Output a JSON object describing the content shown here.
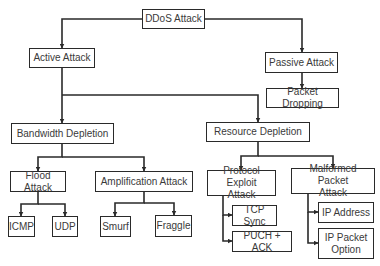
{
  "diagram": {
    "type": "hierarchy",
    "nodes": [
      {
        "id": "ddos",
        "label": "DDoS Attack",
        "x": 142,
        "y": 9,
        "w": 63,
        "h": 20
      },
      {
        "id": "active",
        "label": "Active Attack",
        "x": 29,
        "y": 48,
        "w": 66,
        "h": 20
      },
      {
        "id": "passive",
        "label": "Passive Attack",
        "x": 265,
        "y": 52,
        "w": 73,
        "h": 21
      },
      {
        "id": "packet_dropping",
        "label": "Packet Dropping",
        "x": 266,
        "y": 88,
        "w": 73,
        "h": 20
      },
      {
        "id": "bandwidth",
        "label": "Bandwidth Depletion",
        "x": 11,
        "y": 123,
        "w": 103,
        "h": 21
      },
      {
        "id": "resource",
        "label": "Resource Depletion",
        "x": 206,
        "y": 122,
        "w": 104,
        "h": 20
      },
      {
        "id": "flood",
        "label": "Flood Attack",
        "x": 10,
        "y": 171,
        "w": 56,
        "h": 21
      },
      {
        "id": "amplification",
        "label": "Amplification Attack",
        "x": 95,
        "y": 171,
        "w": 98,
        "h": 21
      },
      {
        "id": "protocol",
        "label": "Protocol Exploit\nAttack",
        "x": 207,
        "y": 170,
        "w": 69,
        "h": 26
      },
      {
        "id": "malformed",
        "label": "Malformed Packet\nAttack",
        "x": 291,
        "y": 168,
        "w": 84,
        "h": 26
      },
      {
        "id": "icmp",
        "label": "ICMP",
        "x": 8,
        "y": 216,
        "w": 27,
        "h": 21
      },
      {
        "id": "udp",
        "label": "UDP",
        "x": 52,
        "y": 216,
        "w": 26,
        "h": 21
      },
      {
        "id": "smurf",
        "label": "Smurf",
        "x": 100,
        "y": 216,
        "w": 31,
        "h": 21
      },
      {
        "id": "fraggle",
        "label": "Fraggle",
        "x": 155,
        "y": 215,
        "w": 37,
        "h": 22
      },
      {
        "id": "tcp_sync",
        "label": "TCP Sync",
        "x": 232,
        "y": 205,
        "w": 45,
        "h": 21
      },
      {
        "id": "puch_ack",
        "label": "PUCH + ACK",
        "x": 232,
        "y": 231,
        "w": 60,
        "h": 21
      },
      {
        "id": "ip_address",
        "label": "IP Address",
        "x": 318,
        "y": 202,
        "w": 56,
        "h": 21
      },
      {
        "id": "ip_packet_option",
        "label": "IP Packet\nOption",
        "x": 318,
        "y": 228,
        "w": 56,
        "h": 31
      }
    ],
    "edges": [
      {
        "from": "ddos",
        "to": "active",
        "points": [
          [
            142,
            19
          ],
          [
            62,
            19
          ],
          [
            62,
            48
          ]
        ]
      },
      {
        "from": "ddos",
        "to": "passive",
        "points": [
          [
            205,
            19
          ],
          [
            302,
            19
          ],
          [
            302,
            52
          ]
        ]
      },
      {
        "from": "passive",
        "to": "packet_dropping",
        "points": [
          [
            302,
            73
          ],
          [
            302,
            88
          ]
        ]
      },
      {
        "from": "active",
        "to": "bandwidth",
        "points": [
          [
            62,
            68
          ],
          [
            62,
            123
          ]
        ]
      },
      {
        "from": "active",
        "to": "resource",
        "points": [
          [
            62,
            95
          ],
          [
            258,
            95
          ],
          [
            258,
            122
          ]
        ]
      },
      {
        "from": "bandwidth",
        "to": "flood",
        "points": [
          [
            62,
            144
          ],
          [
            62,
            157
          ],
          [
            38,
            157
          ],
          [
            38,
            171
          ]
        ]
      },
      {
        "from": "bandwidth",
        "to": "amplification",
        "points": [
          [
            62,
            157
          ],
          [
            144,
            157
          ],
          [
            144,
            171
          ]
        ]
      },
      {
        "from": "flood",
        "to": "icmp",
        "points": [
          [
            38,
            192
          ],
          [
            38,
            204
          ],
          [
            21,
            204
          ],
          [
            21,
            216
          ]
        ]
      },
      {
        "from": "flood",
        "to": "udp",
        "points": [
          [
            38,
            204
          ],
          [
            65,
            204
          ],
          [
            65,
            216
          ]
        ]
      },
      {
        "from": "amplification",
        "to": "smurf",
        "points": [
          [
            144,
            192
          ],
          [
            144,
            203
          ],
          [
            115,
            203
          ],
          [
            115,
            216
          ]
        ]
      },
      {
        "from": "amplification",
        "to": "fraggle",
        "points": [
          [
            144,
            203
          ],
          [
            174,
            203
          ],
          [
            174,
            215
          ]
        ]
      },
      {
        "from": "resource",
        "to": "protocol",
        "points": [
          [
            258,
            142
          ],
          [
            258,
            156
          ],
          [
            241,
            156
          ],
          [
            241,
            170
          ]
        ]
      },
      {
        "from": "resource",
        "to": "malformed",
        "points": [
          [
            258,
            156
          ],
          [
            333,
            156
          ],
          [
            333,
            168
          ]
        ]
      },
      {
        "from": "protocol",
        "to": "tcp_sync",
        "points": [
          [
            223,
            196
          ],
          [
            223,
            215
          ],
          [
            232,
            215
          ]
        ]
      },
      {
        "from": "protocol",
        "to": "puch_ack",
        "points": [
          [
            223,
            215
          ],
          [
            223,
            241
          ],
          [
            232,
            241
          ]
        ]
      },
      {
        "from": "malformed",
        "to": "ip_address",
        "points": [
          [
            308,
            194
          ],
          [
            308,
            212
          ],
          [
            318,
            212
          ]
        ]
      },
      {
        "from": "malformed",
        "to": "ip_packet_option",
        "points": [
          [
            308,
            212
          ],
          [
            308,
            243
          ],
          [
            318,
            243
          ]
        ]
      }
    ],
    "colors": {
      "stroke": "#2a2a2a",
      "text": "#3a3a3a",
      "background": "#ffffff"
    }
  }
}
